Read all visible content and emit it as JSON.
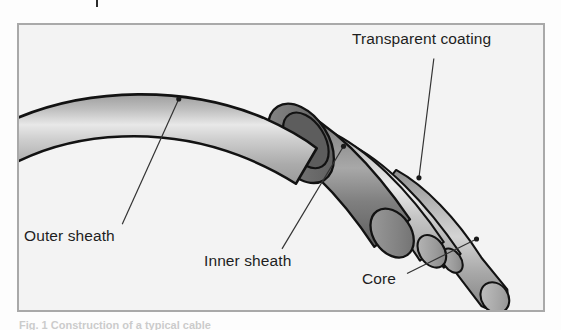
{
  "figure": {
    "frame": {
      "border_color": "#a9a9a9",
      "background_color": "#f3f3f3"
    },
    "caption": "Fig. 1  Construction of a typical cable",
    "labels": [
      {
        "id": "transparent-coating",
        "text": "Transparent coating"
      },
      {
        "id": "outer-sheath",
        "text": "Outer sheath"
      },
      {
        "id": "inner-sheath",
        "text": "Inner sheath"
      },
      {
        "id": "core",
        "text": "Core"
      }
    ],
    "colors": {
      "outline": "#121212",
      "outer_sheath_mid": "#b8b8b8",
      "outer_sheath_highlight": "#e6e6e6",
      "outer_sheath_shadow": "#9d9d9d",
      "inner_sheath_mid": "#8d8d8d",
      "inner_sheath_highlight": "#b6b6b6",
      "inner_sheath_shadow": "#6d6d6d",
      "coating_mid": "#c9c9c9",
      "coating_highlight": "#ececec",
      "core_mid": "#b0b0b0",
      "ring_face": "#7c7c7c",
      "leader_line": "#333333",
      "background": "#f3f3f3"
    },
    "leaders": [
      {
        "id": "leader-transparent-coating",
        "from": [
          418,
          34
        ],
        "to": [
          403,
          155
        ]
      },
      {
        "id": "leader-outer-sheath",
        "from": [
          161,
          75
        ],
        "to": [
          104,
          202
        ]
      },
      {
        "id": "leader-inner-sheath",
        "from": [
          327,
          123
        ],
        "to": [
          265,
          227
        ]
      },
      {
        "id": "leader-core",
        "from": [
          461,
          217
        ],
        "to": [
          391,
          252
        ]
      }
    ],
    "parts": [
      {
        "id": "outer-sheath-body",
        "name": "outer-sheath"
      },
      {
        "id": "outer-sheath-cut",
        "name": "outer-sheath-cut-end"
      },
      {
        "id": "inner-sheath-body",
        "name": "inner-sheath"
      },
      {
        "id": "inner-sheath-cut",
        "name": "inner-sheath-cut-end"
      },
      {
        "id": "coating-body",
        "name": "transparent-coating"
      },
      {
        "id": "coating-cut",
        "name": "transparent-coating-cut-end"
      },
      {
        "id": "core-body",
        "name": "core"
      },
      {
        "id": "core-tip",
        "name": "core-tip"
      }
    ]
  }
}
